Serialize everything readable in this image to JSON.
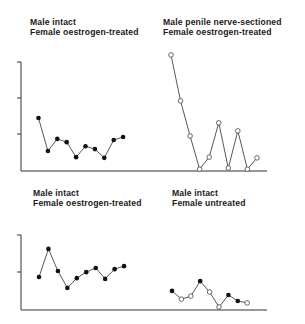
{
  "panels": [
    {
      "title_line1": "Male intact",
      "title_line2": "Female oestrogen-treated"
    },
    {
      "title_line1": "Male penile nerve-sectioned",
      "title_line2": "Female oestrogen-treated"
    },
    {
      "title_line1": "Male intact",
      "title_line2": "Female oestrogen-treated"
    },
    {
      "title_line1": "Male intact",
      "title_line2": "Female untreated"
    }
  ],
  "chart_data": [
    {
      "type": "line",
      "title": "Male intact / Female oestrogen-treated",
      "xlabel": "",
      "ylabel": "",
      "ylim": [
        0,
        3
      ],
      "y_ticks_unlabeled": [
        1,
        2,
        3
      ],
      "grid": false,
      "series": [
        {
          "name": "intact",
          "marker": "filled",
          "x": [
            1,
            2,
            3,
            4,
            5,
            6,
            7,
            8,
            9,
            10
          ],
          "values": [
            1.45,
            0.55,
            0.88,
            0.79,
            0.38,
            0.68,
            0.6,
            0.36,
            0.85,
            0.93
          ]
        }
      ]
    },
    {
      "type": "line",
      "title": "Male penile nerve-sectioned / Female oestrogen-treated",
      "xlabel": "",
      "ylabel": "",
      "ylim": [
        0,
        3
      ],
      "grid": false,
      "series": [
        {
          "name": "nerve-sectioned",
          "marker": "open",
          "x": [
            15,
            16,
            17,
            18,
            19,
            20,
            21,
            22,
            23,
            24
          ],
          "values": [
            3.18,
            1.92,
            0.96,
            0.05,
            0.38,
            1.32,
            0.08,
            1.1,
            0.05,
            0.36
          ]
        }
      ]
    },
    {
      "type": "line",
      "title": "Male intact / Female oestrogen-treated",
      "xlabel": "",
      "ylabel": "",
      "ylim": [
        0,
        2
      ],
      "y_ticks_unlabeled": [
        1,
        2
      ],
      "grid": false,
      "series": [
        {
          "name": "intact",
          "marker": "filled",
          "x": [
            1,
            2,
            3,
            4,
            5,
            6,
            7,
            8,
            9,
            10
          ],
          "values": [
            0.88,
            1.63,
            1.04,
            0.59,
            0.85,
            1.01,
            1.12,
            0.83,
            1.09,
            1.17
          ]
        }
      ]
    },
    {
      "type": "line",
      "title": "Male intact / Female untreated",
      "xlabel": "",
      "ylabel": "",
      "ylim": [
        0,
        2
      ],
      "grid": false,
      "series": [
        {
          "name": "intact",
          "markers": [
            "filled",
            "open",
            "open",
            "filled",
            "open",
            "open",
            "filled",
            "filled",
            "open"
          ],
          "x": [
            15,
            16,
            17,
            18,
            19,
            20,
            21,
            22,
            23
          ],
          "values": [
            0.51,
            0.29,
            0.37,
            0.77,
            0.48,
            0.08,
            0.4,
            0.24,
            0.19
          ]
        }
      ]
    }
  ]
}
